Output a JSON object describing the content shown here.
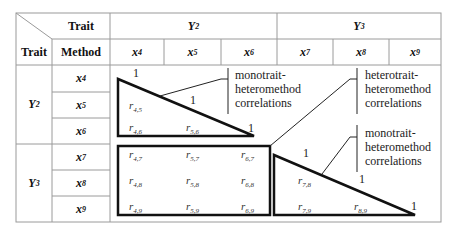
{
  "header": {
    "corner_top": "Trait",
    "corner_bottom_trait": "Trait",
    "corner_bottom_method": "Method",
    "trait_groups": [
      {
        "label": "Y",
        "sub": "2"
      },
      {
        "label": "Y",
        "sub": "3"
      }
    ],
    "method_columns": [
      {
        "label": "x",
        "sub": "4"
      },
      {
        "label": "x",
        "sub": "5"
      },
      {
        "label": "x",
        "sub": "6"
      },
      {
        "label": "x",
        "sub": "7"
      },
      {
        "label": "x",
        "sub": "8"
      },
      {
        "label": "x",
        "sub": "9"
      }
    ]
  },
  "rows": {
    "trait_groups": [
      {
        "label": "Y",
        "sub": "2"
      },
      {
        "label": "Y",
        "sub": "3"
      }
    ],
    "methods": [
      {
        "label": "x",
        "sub": "4"
      },
      {
        "label": "x",
        "sub": "5"
      },
      {
        "label": "x",
        "sub": "6"
      },
      {
        "label": "x",
        "sub": "7"
      },
      {
        "label": "x",
        "sub": "8"
      },
      {
        "label": "x",
        "sub": "9"
      }
    ]
  },
  "correlations": {
    "diagonal": "1",
    "r_prefix": "r",
    "block_y2": [
      {
        "sub": "4,5"
      },
      {
        "sub": "4,6"
      },
      {
        "sub": "5,6"
      }
    ],
    "block_cross": [
      {
        "sub": "4,7"
      },
      {
        "sub": "5,7"
      },
      {
        "sub": "6,7"
      },
      {
        "sub": "4,8"
      },
      {
        "sub": "5,8"
      },
      {
        "sub": "6,8"
      },
      {
        "sub": "4,9"
      },
      {
        "sub": "5,9"
      },
      {
        "sub": "6,9"
      }
    ],
    "block_y3": [
      {
        "sub": "7,8"
      },
      {
        "sub": "7,9"
      },
      {
        "sub": "8,9"
      }
    ]
  },
  "annotations": {
    "mono_top": [
      "monotrait-",
      "heteromethod",
      "correlations"
    ],
    "hetero": [
      "heterotrait-",
      "heteromethod",
      "correlations"
    ],
    "mono_bottom": [
      "monotrait-",
      "heteromethod",
      "correlations"
    ]
  },
  "colors": {
    "grid": "#9a9a9a",
    "shape_stroke": "#111111",
    "text": "#222222"
  }
}
